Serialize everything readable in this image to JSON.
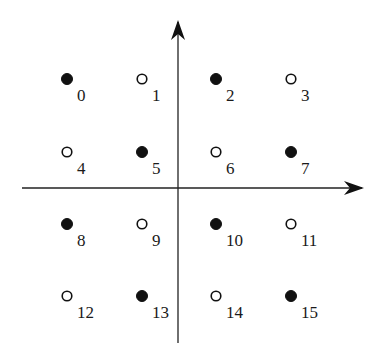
{
  "diagram": {
    "title": "",
    "type": "16-point constellation (4x4 grid) with two-class checkerboard labeling",
    "axes": {
      "origin": [
        178,
        188
      ],
      "horizontal": {
        "from": [
          22,
          188
        ],
        "to": [
          362,
          188
        ],
        "arrow": "right"
      },
      "vertical": {
        "from": [
          178,
          343
        ],
        "to": [
          178,
          22
        ],
        "arrow": "up"
      }
    },
    "grid": {
      "columns_x": [
        67,
        142,
        216,
        291
      ],
      "rows_y": [
        79,
        152,
        224,
        296
      ]
    },
    "legend": {
      "filled": "filled dot",
      "hollow": "hollow dot"
    },
    "points": [
      {
        "index": 0,
        "label": "0",
        "row": 0,
        "col": 0,
        "style": "filled"
      },
      {
        "index": 1,
        "label": "1",
        "row": 0,
        "col": 1,
        "style": "hollow"
      },
      {
        "index": 2,
        "label": "2",
        "row": 0,
        "col": 2,
        "style": "filled"
      },
      {
        "index": 3,
        "label": "3",
        "row": 0,
        "col": 3,
        "style": "hollow"
      },
      {
        "index": 4,
        "label": "4",
        "row": 1,
        "col": 0,
        "style": "hollow"
      },
      {
        "index": 5,
        "label": "5",
        "row": 1,
        "col": 1,
        "style": "filled"
      },
      {
        "index": 6,
        "label": "6",
        "row": 1,
        "col": 2,
        "style": "hollow"
      },
      {
        "index": 7,
        "label": "7",
        "row": 1,
        "col": 3,
        "style": "filled"
      },
      {
        "index": 8,
        "label": "8",
        "row": 2,
        "col": 0,
        "style": "filled"
      },
      {
        "index": 9,
        "label": "9",
        "row": 2,
        "col": 1,
        "style": "hollow"
      },
      {
        "index": 10,
        "label": "10",
        "row": 2,
        "col": 2,
        "style": "filled"
      },
      {
        "index": 11,
        "label": "11",
        "row": 2,
        "col": 3,
        "style": "hollow"
      },
      {
        "index": 12,
        "label": "12",
        "row": 3,
        "col": 0,
        "style": "hollow"
      },
      {
        "index": 13,
        "label": "13",
        "row": 3,
        "col": 1,
        "style": "filled"
      },
      {
        "index": 14,
        "label": "14",
        "row": 3,
        "col": 2,
        "style": "hollow"
      },
      {
        "index": 15,
        "label": "15",
        "row": 3,
        "col": 3,
        "style": "filled"
      }
    ]
  }
}
